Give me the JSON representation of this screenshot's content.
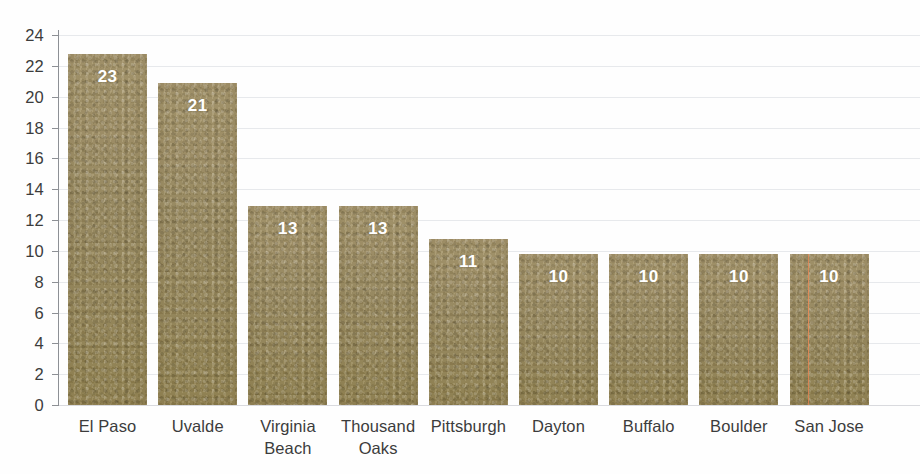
{
  "chart_data": {
    "type": "bar",
    "title": "",
    "subtitle": "",
    "xlabel": "",
    "ylabel": "",
    "categories": [
      "El Paso",
      "Uvalde",
      "Virginia Beach",
      "Thousand Oaks",
      "Pittsburgh",
      "Dayton",
      "Buffalo",
      "Boulder",
      "San Jose"
    ],
    "values": [
      23,
      21,
      13,
      13,
      11,
      10,
      10,
      10,
      10
    ],
    "bar_heights": [
      22.8,
      20.9,
      12.9,
      12.9,
      10.8,
      9.8,
      9.8,
      9.8,
      9.8
    ],
    "data_labels": [
      "23",
      "21",
      "13",
      "13",
      "11",
      "10",
      "10",
      "10",
      "10"
    ],
    "ylim": [
      0,
      24
    ],
    "ytick_step": 2,
    "yticks": [
      24,
      22,
      20,
      18,
      16,
      14,
      12,
      10,
      8,
      6,
      4,
      2,
      0
    ],
    "ytick_labels": [
      "24",
      "22",
      "20",
      "18",
      "16",
      "14",
      "12",
      "10",
      "8",
      "6",
      "4",
      "2",
      "0"
    ],
    "grid": true,
    "grid_axis": "y",
    "legend": false,
    "legend_position": "none",
    "orientation": "vertical",
    "bar_color": "#9b8a5f",
    "label_color": "#ffffff",
    "gridline_color": "#e7e9ec",
    "axis_color": "#8d9095",
    "text_color": "#3c3c3c",
    "background_color": "#fefefe",
    "artifact_line_color": "#e2845 2"
  },
  "annotations": {
    "fold_line_color": "#e28452",
    "fold_line_category": "San Jose"
  }
}
